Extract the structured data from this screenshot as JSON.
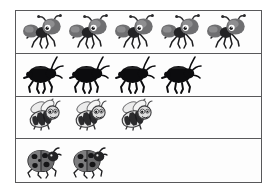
{
  "chart_data": {
    "type": "pictograph",
    "title": "",
    "xlabel": "",
    "ylabel": "",
    "categories": [
      "ants",
      "beetles",
      "bees",
      "ladybugs"
    ],
    "values": [
      5,
      4,
      3,
      2
    ],
    "icon_unit": 1,
    "grid": true,
    "legend": "none",
    "rows": [
      {
        "name": "ants",
        "count": 5,
        "icon": "ant-icon",
        "label": "",
        "color": "#6e6e70"
      },
      {
        "name": "beetles",
        "count": 4,
        "icon": "beetle-icon",
        "label": "",
        "color": "#111113"
      },
      {
        "name": "bees",
        "count": 3,
        "icon": "bee-icon",
        "label": "",
        "color": "#d9d9d9"
      },
      {
        "name": "ladybugs",
        "count": 2,
        "icon": "ladybug-icon",
        "label": "",
        "color": "#7a7a7c"
      }
    ]
  },
  "frame": {
    "border_color": "#58585a",
    "background_color": "#ffffff"
  }
}
